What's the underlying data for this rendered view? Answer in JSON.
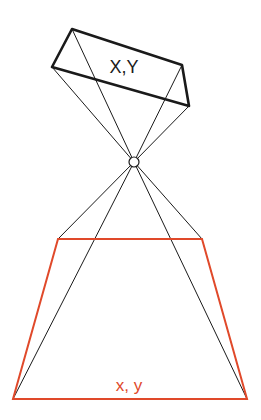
{
  "diagram": {
    "type": "pinhole-projection",
    "colors": {
      "image_plane": "#1a1a1a",
      "object_plane": "#e0492a",
      "rays": "#1a1a1a",
      "background": "#ffffff"
    },
    "image_plane": {
      "label": "X,Y",
      "corners": [
        [
          72,
          29
        ],
        [
          182,
          65
        ],
        [
          189,
          106
        ],
        [
          52,
          67
        ]
      ]
    },
    "pinhole": {
      "center": [
        134,
        162
      ],
      "radius": 5
    },
    "object_plane": {
      "label": "x, y",
      "corners": [
        [
          58,
          239
        ],
        [
          202,
          239
        ],
        [
          247,
          399
        ],
        [
          13,
          399
        ]
      ]
    }
  }
}
